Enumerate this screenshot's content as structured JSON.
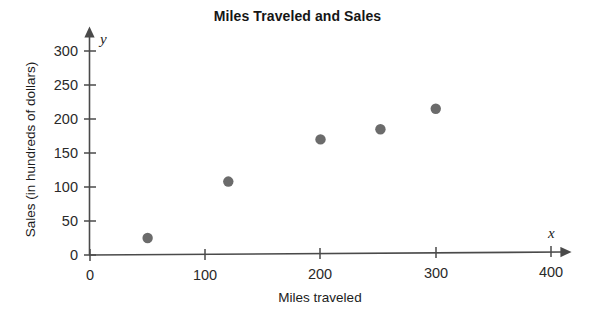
{
  "chart_data": {
    "type": "scatter",
    "title": "Miles Traveled and Sales",
    "xlabel": "Miles traveled",
    "ylabel": "Sales (in hundreds of dollars)",
    "x_axis_variable": "x",
    "y_axis_variable": "y",
    "xlim": [
      0,
      400
    ],
    "ylim": [
      0,
      300
    ],
    "xticks": [
      0,
      100,
      200,
      300,
      400
    ],
    "yticks": [
      0,
      50,
      100,
      150,
      200,
      250,
      300
    ],
    "xtick_labels": [
      "0",
      "100",
      "200",
      "300",
      "400"
    ],
    "ytick_labels": [
      "0",
      "50",
      "100",
      "150",
      "200",
      "250",
      "300"
    ],
    "grid": false,
    "legend": false,
    "marker_color": "#6b6b6b",
    "axis_color": "#4a4a4a",
    "points": [
      {
        "x": 50,
        "y": 25
      },
      {
        "x": 120,
        "y": 108
      },
      {
        "x": 200,
        "y": 170
      },
      {
        "x": 252,
        "y": 185
      },
      {
        "x": 300,
        "y": 215
      }
    ]
  }
}
